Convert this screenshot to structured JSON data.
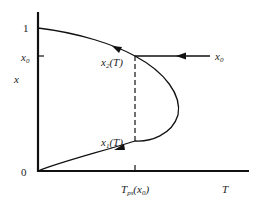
{
  "diagram": {
    "y_axis_label": "x",
    "x_axis_label": "T",
    "y_ticks": {
      "one": "1",
      "x0": "x",
      "x0_sub": "0",
      "zero": "0"
    },
    "x_tick": {
      "main": "T",
      "sub": "ps",
      "arg_open": "(x",
      "arg_sub": "0",
      "arg_close": ")"
    },
    "upper_branch": {
      "name": "x",
      "sub": "2",
      "arg": "(T)"
    },
    "lower_branch": {
      "name": "x",
      "sub": "1",
      "arg": "(T)"
    },
    "input_label": {
      "name": "x",
      "sub": "0"
    },
    "colors": {
      "line": "#111111",
      "background": "#ffffff"
    }
  }
}
